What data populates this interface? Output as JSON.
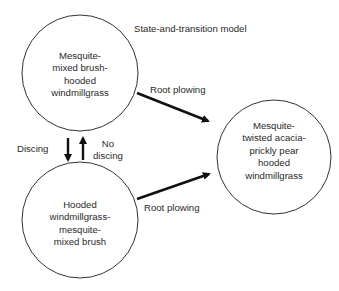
{
  "diagram": {
    "title": "State-and-transition model",
    "states": [
      {
        "id": "state-1",
        "label": "Mesquite-\nmixed brush-\nhooded\nwindmillgrass"
      },
      {
        "id": "state-2",
        "label": "Hooded\nwindmillgrass-\nmesquite-\nmixed brush"
      },
      {
        "id": "state-3",
        "label": "Mesquite-\ntwisted acacia-\nprickly pear\nhooded\nwindmillgrass"
      }
    ],
    "transitions": [
      {
        "from": "state-1",
        "to": "state-3",
        "label": "Root plowing"
      },
      {
        "from": "state-2",
        "to": "state-3",
        "label": "Root plowing"
      },
      {
        "from": "state-1",
        "to": "state-2",
        "label": "Discing"
      },
      {
        "from": "state-2",
        "to": "state-1",
        "label": "No\ndiscing"
      }
    ],
    "colors": {
      "line": "#111111",
      "text": "#2a2a2a",
      "background": "#ffffff"
    }
  }
}
